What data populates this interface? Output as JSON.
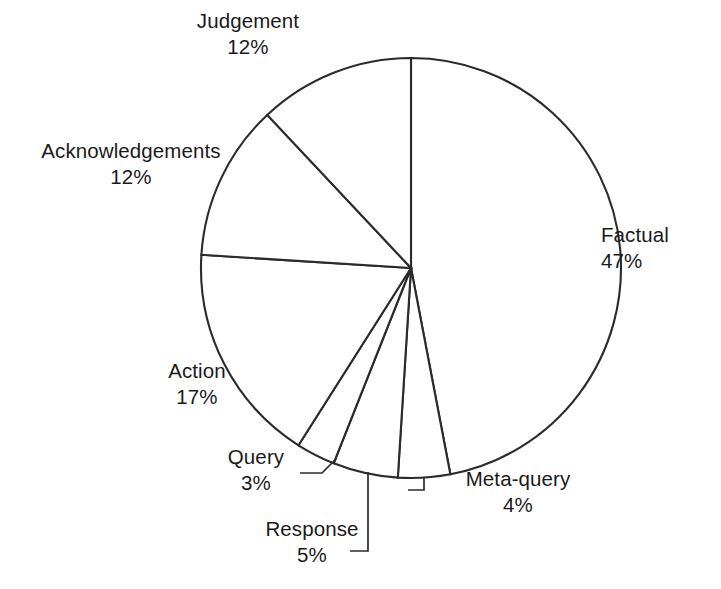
{
  "chart_data": {
    "type": "pie",
    "title": "",
    "subtitle": "",
    "xlabel": "",
    "ylabel": "",
    "legend": "none",
    "grid": false,
    "units": "percent",
    "start_angle_deg": 0,
    "direction": "clockwise",
    "center": {
      "x": 411,
      "y": 268
    },
    "radius": 210,
    "categories": [
      "Factual",
      "Meta-query",
      "Response",
      "Query",
      "Action",
      "Acknowledgements",
      "Judgement"
    ],
    "values": [
      47,
      4,
      5,
      3,
      17,
      12,
      12
    ],
    "slices": [
      {
        "label": "Factual",
        "value": 47,
        "percent_text": "47%",
        "start_deg": 0.0,
        "end_deg": 169.2
      },
      {
        "label": "Meta-query",
        "value": 4,
        "percent_text": "4%",
        "start_deg": 169.2,
        "end_deg": 183.6
      },
      {
        "label": "Response",
        "value": 5,
        "percent_text": "5%",
        "start_deg": 183.6,
        "end_deg": 201.6
      },
      {
        "label": "Query",
        "value": 3,
        "percent_text": "3%",
        "start_deg": 201.6,
        "end_deg": 212.4
      },
      {
        "label": "Action",
        "value": 17,
        "percent_text": "17%",
        "start_deg": 212.4,
        "end_deg": 273.6
      },
      {
        "label": "Acknowledgements",
        "value": 12,
        "percent_text": "12%",
        "start_deg": 273.6,
        "end_deg": 316.8
      },
      {
        "label": "Judgement",
        "value": 12,
        "percent_text": "12%",
        "start_deg": 316.8,
        "end_deg": 360.0
      }
    ],
    "colors": {
      "slice_fill": "#ffffff",
      "slice_outline": "#2b2b2b",
      "text": "#1a1a1a",
      "background": "#ffffff"
    }
  },
  "labels": {
    "judgement": {
      "name": "Judgement",
      "pct": "12%"
    },
    "acknowledgements": {
      "name": "Acknowledgements",
      "pct": "12%"
    },
    "factual": {
      "name": "Factual",
      "pct": "47%"
    },
    "action": {
      "name": "Action",
      "pct": "17%"
    },
    "query": {
      "name": "Query",
      "pct": "3%"
    },
    "response": {
      "name": "Response",
      "pct": "5%"
    },
    "metaquery": {
      "name": "Meta-query",
      "pct": "4%"
    }
  }
}
